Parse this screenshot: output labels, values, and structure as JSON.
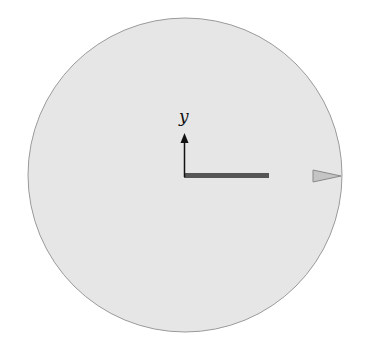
{
  "diagram": {
    "axis_label": "y",
    "colors": {
      "disk_fill": "#e6e6e6",
      "disk_stroke": "#9a9a9a",
      "axis": "#111111",
      "bar": "#555555",
      "marker_fill": "#c4c4c4",
      "marker_stroke": "#8a8a8a"
    },
    "elements": [
      {
        "name": "circular-disk",
        "description": "light gray disk"
      },
      {
        "name": "y-axis-arrow",
        "description": "upward arrow from disk center"
      },
      {
        "name": "radial-bar",
        "description": "dark horizontal bar from center toward rim"
      },
      {
        "name": "rim-marker-triangle",
        "description": "gray triangle pointer at right rim"
      }
    ]
  }
}
